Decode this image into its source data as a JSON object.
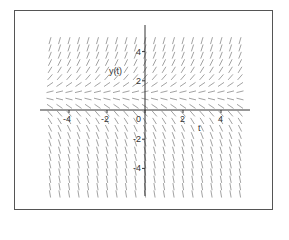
{
  "chart_data": {
    "type": "direction_field",
    "title": "",
    "xlabel": "t",
    "ylabel": "y(t)",
    "xlim": [
      -5.5,
      5.5
    ],
    "ylim": [
      -6,
      5.5
    ],
    "x_ticks": [
      -4,
      -2,
      0,
      2,
      4
    ],
    "x_tick_labels": [
      "-4",
      "-2",
      "0",
      "2",
      "4"
    ],
    "y_ticks": [
      4,
      2,
      -2,
      -4
    ],
    "y_tick_labels": [
      "4",
      "2",
      "-2",
      "-4"
    ],
    "origin_label": "0",
    "equilibrium_y": 1,
    "slope_model": "dy/dt = k*(y - 1)",
    "slope_k": 1.2,
    "grid_columns_t": [
      -5,
      -4.5,
      -4,
      -3.5,
      -3,
      -2.5,
      -2,
      -1.5,
      -1,
      -0.5,
      0,
      0.5,
      1,
      1.5,
      2,
      2.5,
      3,
      3.5,
      4,
      4.5,
      5
    ],
    "grid_row_step_y": 0.5,
    "grid": false,
    "legend": null
  },
  "colors": {
    "axis": "#333333",
    "field": "#8a8a8a",
    "frame": "#555555",
    "background": "#ffffff"
  }
}
